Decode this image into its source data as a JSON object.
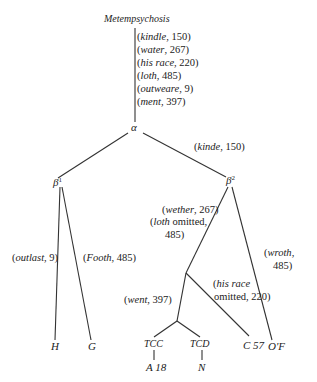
{
  "title": "Metempsychosis",
  "nodes": {
    "alpha": "α",
    "beta1": "β",
    "beta1_sup": "1",
    "beta2": "β",
    "beta2_sup": "2",
    "H": "H",
    "G": "G",
    "TCC": "TCC",
    "TCD": "TCD",
    "C57": "C 57",
    "A18": "A 18",
    "N": "N",
    "O": "O",
    "O_sup": "'",
    "F": "F"
  },
  "root_readings": [
    {
      "word": "kindle",
      "line": "150"
    },
    {
      "word": "water",
      "line": "267"
    },
    {
      "word": "his race",
      "line": "220"
    },
    {
      "word": "loth",
      "line": "485"
    },
    {
      "word": "outweare",
      "line": "9"
    },
    {
      "word": "ment",
      "line": "397"
    }
  ],
  "edges": {
    "alpha_beta2": {
      "word": "kinde",
      "line": "150"
    },
    "beta1_H": {
      "word": "outlast",
      "line": "9"
    },
    "beta1_G": {
      "word": "Footh",
      "line": "485"
    },
    "beta2_left_1": {
      "word": "wether",
      "line": "267"
    },
    "beta2_left_2": {
      "word": "loth",
      "rest": " omitted,"
    },
    "beta2_left_3": {
      "line": "485"
    },
    "beta2_OF_1": {
      "word": "wroth",
      "sep": ","
    },
    "beta2_OF_2": {
      "line": "485"
    },
    "to_C57_1": {
      "word": "his race"
    },
    "to_C57_2": {
      "rest": "omitted, 220"
    },
    "went": {
      "word": "went",
      "line": "397"
    }
  }
}
